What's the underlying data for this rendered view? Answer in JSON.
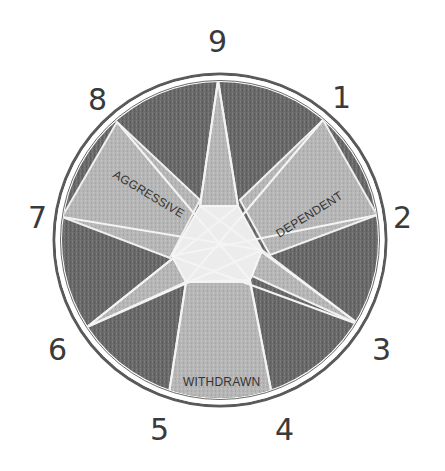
{
  "diagram": {
    "type": "enneagram-hornevian-groups",
    "points": [
      {
        "label": "9",
        "x": 218,
        "y": 80
      },
      {
        "label": "1",
        "x": 323,
        "y": 120
      },
      {
        "label": "2",
        "x": 377,
        "y": 215
      },
      {
        "label": "3",
        "x": 360,
        "y": 325
      },
      {
        "label": "4",
        "x": 273,
        "y": 398
      },
      {
        "label": "5",
        "x": 168,
        "y": 398
      },
      {
        "label": "6",
        "x": 87,
        "y": 327
      },
      {
        "label": "7",
        "x": 65,
        "y": 217
      },
      {
        "label": "8",
        "x": 117,
        "y": 122
      }
    ],
    "number_labels": {
      "n9": "9",
      "n1": "1",
      "n2": "2",
      "n3": "3",
      "n4": "4",
      "n5": "5",
      "n6": "6",
      "n7": "7",
      "n8": "8"
    },
    "groups": {
      "aggressive": "AGGRESSIVE",
      "dependent": "DEPENDENT",
      "withdrawn": "WITHDRAWN"
    },
    "colors": {
      "background": "#ffffff",
      "dark_fill": "#6e6e6e",
      "light_fill": "#b4b4b4",
      "center_fill": "#e8e8e8",
      "ring": "#5a5a5a",
      "line": "#f2f2f2",
      "text": "#333333"
    }
  }
}
